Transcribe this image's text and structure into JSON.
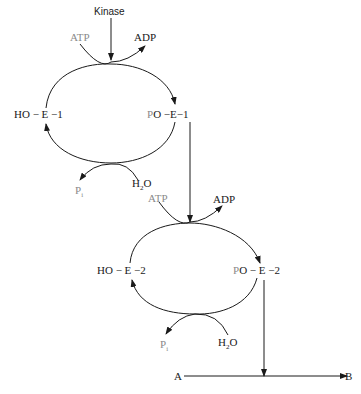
{
  "diagram": {
    "type": "phosphorylation cascade (kinase cycles)",
    "top_input": "Kinase",
    "cycle1": {
      "left_species": "HO − E − 1",
      "right_species": "PO − E − 1",
      "top_in": "ATP",
      "top_out": "ADP",
      "bottom_in": "H2O",
      "bottom_out": "Pi"
    },
    "cycle2": {
      "left_species": "HO − E − 2",
      "right_species": "PO − E − 2",
      "top_in": "ATP",
      "top_out": "ADP",
      "bottom_in": "H2O",
      "bottom_out": "Pi"
    },
    "reaction": {
      "substrate": "A",
      "product": "B"
    }
  },
  "labels": {
    "kinase": "Kinase",
    "atp": "ATP",
    "adp": "ADP",
    "h2o_h": "H",
    "h2o_sub": "2",
    "h2o_o": "O",
    "pi_p": "P",
    "pi_sub": "i",
    "ho_e1": "HO − E −1",
    "po_e1_p": "P",
    "po_e1_rest": "O −E−1",
    "ho_e2": "HO − E −2",
    "po_e2_p": "P",
    "po_e2_rest": "O − E −2",
    "a": "A",
    "b": "B"
  }
}
